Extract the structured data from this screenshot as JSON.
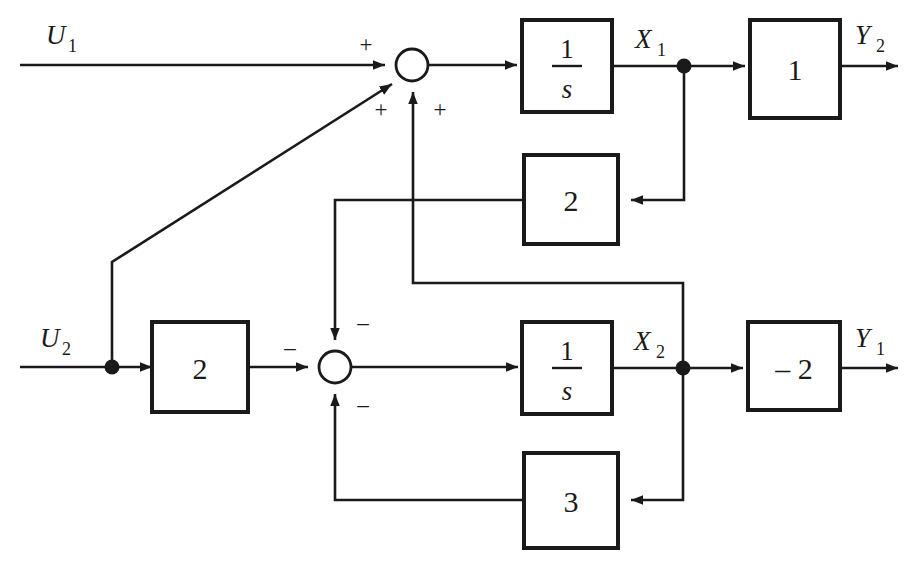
{
  "diagram": {
    "type": "control-system-block-diagram",
    "stroke_color": "#1a1a1a",
    "background_color": "#ffffff",
    "inputs": [
      {
        "id": "u1",
        "label": "U",
        "subscript": "1"
      },
      {
        "id": "u2",
        "label": "U",
        "subscript": "2"
      }
    ],
    "outputs": [
      {
        "id": "y2",
        "label": "Y",
        "subscript": "2"
      },
      {
        "id": "y1",
        "label": "Y",
        "subscript": "1"
      }
    ],
    "state_signals": [
      {
        "id": "x1",
        "label": "X",
        "subscript": "1"
      },
      {
        "id": "x2",
        "label": "X",
        "subscript": "2"
      }
    ],
    "blocks": [
      {
        "id": "integrator-1",
        "numerator": "1",
        "denominator": "s",
        "kind": "fraction"
      },
      {
        "id": "integrator-2",
        "numerator": "1",
        "denominator": "s",
        "kind": "fraction"
      },
      {
        "id": "gain-output-top",
        "value": "1",
        "kind": "gain"
      },
      {
        "id": "gain-feedback-2-top",
        "value": "2",
        "kind": "gain"
      },
      {
        "id": "gain-input-2-bottom",
        "value": "2",
        "kind": "gain"
      },
      {
        "id": "gain-feedback-3-bottom",
        "value": "3",
        "kind": "gain"
      },
      {
        "id": "gain-output-bottom",
        "value": "– 2",
        "kind": "gain"
      }
    ],
    "summing_junctions": [
      {
        "id": "sum-top",
        "signs": [
          {
            "port": "west",
            "sign": "+"
          },
          {
            "port": "southwest",
            "sign": "+"
          },
          {
            "port": "south",
            "sign": "+"
          }
        ]
      },
      {
        "id": "sum-bottom",
        "signs": [
          {
            "port": "west",
            "sign": "–"
          },
          {
            "port": "north",
            "sign": "–"
          },
          {
            "port": "south",
            "sign": "–"
          }
        ]
      }
    ]
  }
}
